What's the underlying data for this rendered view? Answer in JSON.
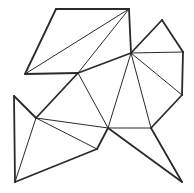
{
  "figure": {
    "stroke_color": "#2a2a2a",
    "thin_width": 1,
    "thick_width": 1.8,
    "vertices": {
      "A": [
        56,
        9
      ],
      "B": [
        129,
        9
      ],
      "C": [
        25,
        74
      ],
      "D": [
        78,
        73
      ],
      "E": [
        131,
        53
      ],
      "F": [
        162,
        20
      ],
      "G": [
        183,
        52
      ],
      "H": [
        182,
        95
      ],
      "I": [
        151,
        128
      ],
      "J": [
        182,
        182
      ],
      "K": [
        108,
        128
      ],
      "L": [
        97,
        149
      ],
      "M": [
        36,
        118
      ],
      "N": [
        14,
        96
      ],
      "O": [
        15,
        182
      ]
    },
    "outline": [
      [
        "A",
        "B"
      ],
      [
        "A",
        "C"
      ],
      [
        "C",
        "D"
      ],
      [
        "D",
        "E"
      ],
      [
        "E",
        "F"
      ],
      [
        "F",
        "G"
      ],
      [
        "G",
        "H"
      ],
      [
        "H",
        "I"
      ],
      [
        "I",
        "J"
      ],
      [
        "J",
        "K"
      ],
      [
        "K",
        "L"
      ],
      [
        "L",
        "O"
      ],
      [
        "O",
        "N"
      ],
      [
        "N",
        "M"
      ],
      [
        "M",
        "D"
      ],
      [
        "B",
        "E"
      ]
    ],
    "inner": [
      [
        "B",
        "C"
      ],
      [
        "B",
        "D"
      ],
      [
        "E",
        "G"
      ],
      [
        "E",
        "H"
      ],
      [
        "E",
        "I"
      ],
      [
        "E",
        "K"
      ],
      [
        "D",
        "K"
      ],
      [
        "K",
        "I"
      ],
      [
        "M",
        "K"
      ],
      [
        "M",
        "L"
      ],
      [
        "M",
        "O"
      ]
    ]
  }
}
